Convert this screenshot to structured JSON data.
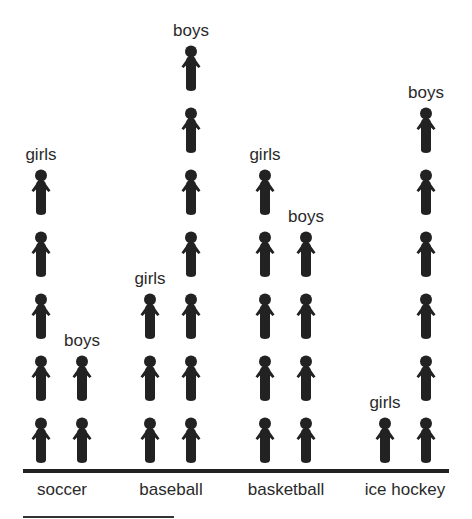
{
  "chart_data": {
    "type": "pictograph",
    "title": "",
    "xlabel": "",
    "ylabel": "",
    "categories": [
      "soccer",
      "baseball",
      "basketball",
      "ice hockey"
    ],
    "series": [
      {
        "name": "girls",
        "values": [
          5,
          3,
          5,
          1
        ]
      },
      {
        "name": "boys",
        "values": [
          2,
          7,
          4,
          6
        ]
      }
    ],
    "icon": "person-icon",
    "icon_color": "#222222",
    "grid": false,
    "legend": "labels above each column"
  },
  "labels": {
    "girls": "girls",
    "boys": "boys",
    "categories": [
      "soccer",
      "baseball",
      "basketball",
      "ice hockey"
    ]
  }
}
